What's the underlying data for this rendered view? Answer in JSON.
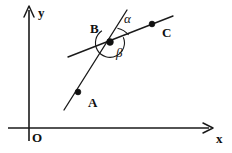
{
  "figure": {
    "background_color": "#ffffff",
    "stroke_color": "#1a1a1a",
    "width": 232,
    "height": 153
  },
  "axes": {
    "origin_label": "O",
    "x_label": "x",
    "y_label": "y",
    "origin_px": {
      "x": 29,
      "y": 128
    },
    "x_axis": {
      "x1": 8,
      "y1": 128,
      "x2": 212,
      "y2": 128,
      "arrow": "right"
    },
    "y_axis": {
      "x1": 29,
      "y1": 140,
      "x2": 29,
      "y2": 7,
      "arrow": "up"
    }
  },
  "points": [
    {
      "label": "A",
      "px": {
        "x": 78,
        "y": 92
      },
      "label_px": {
        "x": 88,
        "y": 97
      }
    },
    {
      "label": "B",
      "px": {
        "x": 110,
        "y": 42
      },
      "label_px": {
        "x": 90,
        "y": 23
      }
    },
    {
      "label": "C",
      "px": {
        "x": 152,
        "y": 24
      },
      "label_px": {
        "x": 162,
        "y": 27
      }
    }
  ],
  "lines": [
    {
      "name": "line-AB-steep",
      "x1": 64,
      "y1": 110,
      "x2": 127,
      "y2": 10
    },
    {
      "name": "line-BC-shallow",
      "x1": 68,
      "y1": 57,
      "x2": 173,
      "y2": 16
    }
  ],
  "angles": [
    {
      "label": "α",
      "name": "alpha",
      "label_px": {
        "x": 124,
        "y": 15
      },
      "position": "upper-right of B"
    },
    {
      "label": "β",
      "name": "beta",
      "label_px": {
        "x": 116,
        "y": 48
      },
      "position": "lower-right of B"
    }
  ]
}
